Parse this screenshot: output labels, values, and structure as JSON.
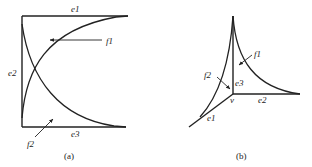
{
  "panel_a": {
    "caption": "(a)",
    "edges": {
      "e1": "e1",
      "e2": "e2",
      "e3": "e3"
    },
    "faces": {
      "f1": "f1",
      "f2": "f2"
    }
  },
  "panel_b": {
    "caption": "(b)",
    "vertex": "v",
    "edges": {
      "e1": "e1",
      "e2": "e2",
      "e3": "e3"
    },
    "faces": {
      "f1": "f1",
      "f2": "f2"
    }
  },
  "colors": {
    "stroke": "#222222",
    "background": "#ffffff"
  }
}
